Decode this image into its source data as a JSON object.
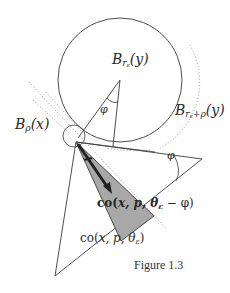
{
  "figure": {
    "caption": "Figure 1.3",
    "colors": {
      "stroke": "#3a3a3a",
      "dotted": "#8a8a8a",
      "shade": "#a8a8a8",
      "arrow": "#222222",
      "background": "#ffffff"
    },
    "labels": {
      "ball_y": {
        "base": "B",
        "sub": "r",
        "subsub": "ε",
        "arg": "(y)"
      },
      "ball_y_expanded": {
        "base": "B",
        "sub": "r",
        "subsub": "ε",
        "sub_extra": "+ρ",
        "arg": "(y)"
      },
      "ball_x": {
        "base": "B",
        "sub": "ρ",
        "arg": "(x)"
      },
      "angle_center": "φ",
      "angle_right": "φ",
      "cone_shaded": {
        "prefix": "co(",
        "args": "x, p, θ",
        "sub": "ε",
        "suffix": " − φ)"
      },
      "cone_outer": {
        "prefix": "co(",
        "args": "x, p, θ",
        "sub": "ε",
        "suffix": ")"
      }
    },
    "geometry": {
      "center_y": [
        120,
        80
      ],
      "radius_main": 62,
      "point_x": [
        76,
        142
      ],
      "small_ball_radius": 12
    }
  }
}
